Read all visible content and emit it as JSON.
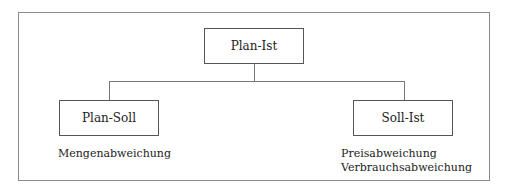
{
  "diagram": {
    "root": {
      "label": "Plan-Ist"
    },
    "children": [
      {
        "label": "Plan-Soll",
        "notes": [
          "Mengenabweichung"
        ]
      },
      {
        "label": "Soll-Ist",
        "notes": [
          "Preisabweichung",
          "Verbrauchsabweichung"
        ]
      }
    ]
  }
}
